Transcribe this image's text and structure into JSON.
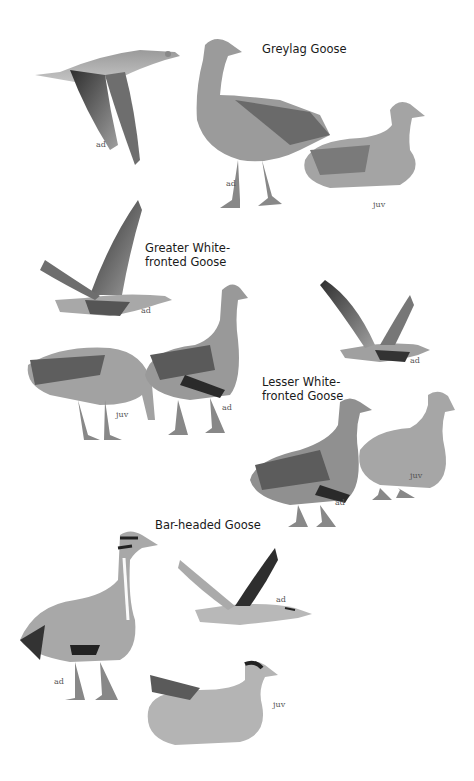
{
  "plate": {
    "species": [
      {
        "name": "Greylag Goose",
        "figures": [
          {
            "pose": "flight",
            "age_label": "ad"
          },
          {
            "pose": "standing",
            "age_label": "ad"
          },
          {
            "pose": "sitting",
            "age_label": "juv"
          }
        ]
      },
      {
        "name": "Greater White-\nfronted Goose",
        "figures": [
          {
            "pose": "flight",
            "age_label": "ad"
          },
          {
            "pose": "feeding",
            "age_label": "juv"
          },
          {
            "pose": "standing",
            "age_label": "ad"
          }
        ]
      },
      {
        "name": "Lesser White-\nfronted Goose",
        "figures": [
          {
            "pose": "flight",
            "age_label": "ad"
          },
          {
            "pose": "standing",
            "age_label": "ad"
          },
          {
            "pose": "standing",
            "age_label": "juv"
          }
        ]
      },
      {
        "name": "Bar-headed Goose",
        "figures": [
          {
            "pose": "standing",
            "age_label": "ad"
          },
          {
            "pose": "flight",
            "age_label": "ad"
          },
          {
            "pose": "sitting",
            "age_label": "juv"
          }
        ]
      }
    ]
  },
  "colors": {
    "background": "#ffffff",
    "plumage_light": "#b8b8b8",
    "plumage_mid": "#8a8a8a",
    "plumage_dark": "#3a3a3a",
    "text": "#1a1a1a"
  }
}
